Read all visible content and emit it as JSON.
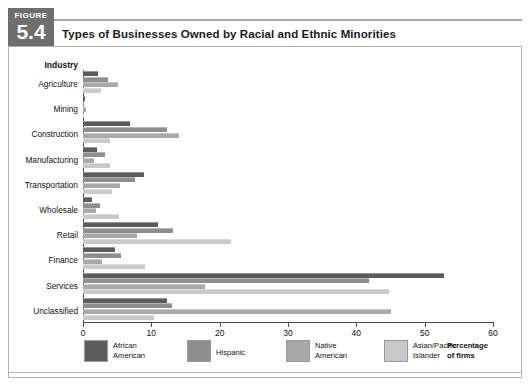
{
  "figure": {
    "label": "FIGURE",
    "number": "5.4",
    "title": "Types of Businesses Owned by Racial and Ethnic Minorities"
  },
  "axis_note": "Percentage\nof firms",
  "industry_header": "Industry",
  "colors": {
    "series": [
      "#5c5c5c",
      "#8e8e8e",
      "#a9a9a9",
      "#c9c9c9"
    ],
    "figure_tag_bg": "#6e6e6e",
    "axis": "#4d4d4d",
    "frame": "#b0b0b0"
  },
  "legend": [
    {
      "label": "African\nAmerican",
      "color": "#5c5c5c"
    },
    {
      "label": "Hispanic",
      "color": "#8e8e8e"
    },
    {
      "label": "Native\nAmerican",
      "color": "#a9a9a9"
    },
    {
      "label": "Asian/Pacific\nIslander",
      "color": "#c9c9c9"
    }
  ],
  "chart_data": {
    "type": "bar",
    "orientation": "horizontal",
    "title": "Types of Businesses Owned by Racial and Ethnic Minorities",
    "xlabel": "Percentage of firms",
    "ylabel": "Industry",
    "xlim": [
      0,
      60
    ],
    "xticks": [
      0,
      10,
      20,
      30,
      40,
      50,
      60
    ],
    "xticklabels": [
      "0",
      "10",
      "20",
      "30",
      "40",
      "50",
      "60"
    ],
    "grid": false,
    "legend_position": "bottom",
    "categories": [
      "Agriculture",
      "Mining",
      "Construction",
      "Manufacturing",
      "Transportation",
      "Wholesale",
      "Retail",
      "Finance",
      "Services",
      "Unclassified"
    ],
    "series": [
      {
        "name": "African American",
        "color": "#5c5c5c",
        "values": [
          2.2,
          0.3,
          6.9,
          2.0,
          8.9,
          1.3,
          11.0,
          4.7,
          52.9,
          12.3
        ]
      },
      {
        "name": "Hispanic",
        "color": "#8e8e8e",
        "values": [
          3.7,
          0.2,
          12.3,
          3.2,
          7.6,
          2.5,
          13.2,
          5.5,
          41.9,
          13.0
        ]
      },
      {
        "name": "Native American",
        "color": "#a9a9a9",
        "values": [
          5.1,
          0.4,
          14.1,
          1.6,
          5.4,
          1.9,
          7.9,
          2.8,
          17.9,
          45.0
        ]
      },
      {
        "name": "Asian/Pacific Islander",
        "color": "#c9c9c9",
        "values": [
          2.7,
          0.2,
          4.0,
          4.0,
          4.2,
          5.3,
          21.7,
          9.1,
          44.8,
          10.4
        ]
      }
    ]
  }
}
